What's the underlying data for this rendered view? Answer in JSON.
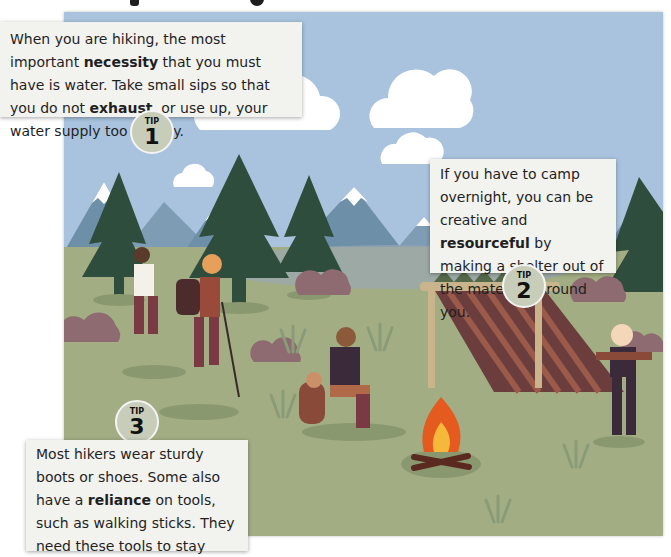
{
  "colors": {
    "sky": "#a9b8c9",
    "ground": "#9aa587",
    "tree": "#2e4a3a",
    "mountain": "#6b7a8c",
    "snow": "#ffffff",
    "bush": "#8a6a73",
    "box": "#f2f2ef",
    "badge": "#c7cdb9",
    "fire": "#e9621e"
  },
  "tips": [
    {
      "label": "TIP",
      "number": "1",
      "parts": [
        "When you are hiking, the most important ",
        "necessity",
        " that you must have is water. Take small sips so that you do not ",
        "exhaust",
        ", or use up, your water supply too quickly."
      ],
      "bold_words": [
        "necessity",
        "exhaust"
      ]
    },
    {
      "label": "TIP",
      "number": "2",
      "parts": [
        "If you have to camp overnight, you can be creative and ",
        "resourceful",
        " by making a shelter out of the materials around you."
      ],
      "bold_words": [
        "resourceful"
      ]
    },
    {
      "label": "TIP",
      "number": "3",
      "parts": [
        "Most hikers wear sturdy boots or shoes. Some also have a ",
        "reliance",
        " on tools, such as walking sticks. They need these tools to stay safe on the trail."
      ],
      "bold_words": [
        "reliance"
      ]
    }
  ]
}
